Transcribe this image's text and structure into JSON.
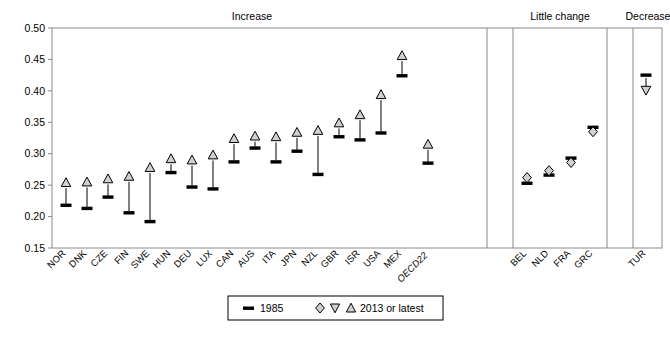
{
  "groups": [
    {
      "name": "Increase",
      "label": "Increase"
    },
    {
      "name": "LittleChange",
      "label": "Little change"
    },
    {
      "name": "Decrease",
      "label": "Decrease"
    }
  ],
  "legend": {
    "old_label": "1985",
    "new_label": "2013 or latest",
    "old_marker": "dash-marker",
    "new_markers": [
      "diamond-marker",
      "triangle-down-marker",
      "triangle-up-marker"
    ]
  },
  "axis": {
    "y_ticks": [
      "0.15",
      "0.20",
      "0.25",
      "0.30",
      "0.35",
      "0.40",
      "0.45",
      "0.50"
    ],
    "y_min": 0.15,
    "y_max": 0.5
  },
  "chart_data": {
    "type": "scatter",
    "title": "",
    "xlabel": "",
    "ylabel": "",
    "ylim": [
      0.15,
      0.5
    ],
    "grid": false,
    "legend_position": "bottom-center",
    "series": [
      {
        "name": "1985",
        "marker": "dash"
      },
      {
        "name": "2013 or latest",
        "marker": "triangle/diamond"
      }
    ],
    "categories": [
      "NOR",
      "DNK",
      "CZE",
      "FIN",
      "SWE",
      "HUN",
      "DEU",
      "LUX",
      "CAN",
      "AUS",
      "ITA",
      "JPN",
      "NZL",
      "GBR",
      "ISR",
      "USA",
      "MEX",
      "OECD22",
      "BEL",
      "NLD",
      "FRA",
      "GRC",
      "TUR"
    ],
    "points": [
      {
        "cat": "NOR",
        "group": "Increase",
        "v1985": 0.218,
        "v2013": 0.25,
        "marker": "triangle-up"
      },
      {
        "cat": "DNK",
        "group": "Increase",
        "v1985": 0.213,
        "v2013": 0.251,
        "marker": "triangle-up"
      },
      {
        "cat": "CZE",
        "group": "Increase",
        "v1985": 0.231,
        "v2013": 0.256,
        "marker": "triangle-up"
      },
      {
        "cat": "FIN",
        "group": "Increase",
        "v1985": 0.206,
        "v2013": 0.26,
        "marker": "triangle-up"
      },
      {
        "cat": "SWE",
        "group": "Increase",
        "v1985": 0.192,
        "v2013": 0.274,
        "marker": "triangle-up"
      },
      {
        "cat": "HUN",
        "group": "Increase",
        "v1985": 0.27,
        "v2013": 0.288,
        "marker": "triangle-up"
      },
      {
        "cat": "DEU",
        "group": "Increase",
        "v1985": 0.247,
        "v2013": 0.286,
        "marker": "triangle-up"
      },
      {
        "cat": "LUX",
        "group": "Increase",
        "v1985": 0.244,
        "v2013": 0.294,
        "marker": "triangle-up"
      },
      {
        "cat": "CAN",
        "group": "Increase",
        "v1985": 0.287,
        "v2013": 0.32,
        "marker": "triangle-up"
      },
      {
        "cat": "AUS",
        "group": "Increase",
        "v1985": 0.309,
        "v2013": 0.324,
        "marker": "triangle-up"
      },
      {
        "cat": "ITA",
        "group": "Increase",
        "v1985": 0.287,
        "v2013": 0.323,
        "marker": "triangle-up"
      },
      {
        "cat": "JPN",
        "group": "Increase",
        "v1985": 0.304,
        "v2013": 0.33,
        "marker": "triangle-up"
      },
      {
        "cat": "NZL",
        "group": "Increase",
        "v1985": 0.267,
        "v2013": 0.333,
        "marker": "triangle-up"
      },
      {
        "cat": "GBR",
        "group": "Increase",
        "v1985": 0.327,
        "v2013": 0.345,
        "marker": "triangle-up"
      },
      {
        "cat": "ISR",
        "group": "Increase",
        "v1985": 0.322,
        "v2013": 0.358,
        "marker": "triangle-up"
      },
      {
        "cat": "USA",
        "group": "Increase",
        "v1985": 0.333,
        "v2013": 0.39,
        "marker": "triangle-up"
      },
      {
        "cat": "MEX",
        "group": "Increase",
        "v1985": 0.424,
        "v2013": 0.452,
        "marker": "triangle-up"
      },
      {
        "cat": "OECD22",
        "group": "Increase",
        "v1985": 0.285,
        "v2013": 0.311,
        "marker": "triangle-up"
      },
      {
        "cat": "BEL",
        "group": "LittleChange",
        "v1985": 0.253,
        "v2013": 0.262,
        "marker": "diamond"
      },
      {
        "cat": "NLD",
        "group": "LittleChange",
        "v1985": 0.266,
        "v2013": 0.273,
        "marker": "diamond"
      },
      {
        "cat": "FRA",
        "group": "LittleChange",
        "v1985": 0.293,
        "v2013": 0.286,
        "marker": "diamond"
      },
      {
        "cat": "GRC",
        "group": "LittleChange",
        "v1985": 0.342,
        "v2013": 0.335,
        "marker": "diamond"
      },
      {
        "cat": "TUR",
        "group": "Decrease",
        "v1985": 0.425,
        "v2013": 0.405,
        "marker": "triangle-down"
      }
    ]
  }
}
